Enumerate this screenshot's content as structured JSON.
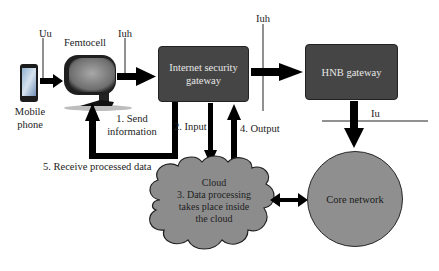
{
  "nodes": {
    "mobile_phone": {
      "label_line1": "Mobile",
      "label_line2": "phone"
    },
    "femtocell": {
      "label": "Femtocell"
    },
    "internet_security_gateway": {
      "label_line1": "Internet security",
      "label_line2": "gateway"
    },
    "hnb_gateway": {
      "label": "HNB gateway"
    },
    "cloud": {
      "title": "Cloud",
      "line1": "3. Data processing",
      "line2": "takes place inside",
      "line3": "the cloud"
    },
    "core_network": {
      "label": "Core network"
    }
  },
  "interfaces": {
    "uu": "Uu",
    "iuh_femto": "Iuh",
    "iuh_gateway": "Iuh",
    "iu": "Iu"
  },
  "steps": {
    "step1_line1": "1. Send",
    "step1_line2": "information",
    "step2": "2. Input",
    "step4": "4. Output",
    "step5": "5. Receive processed data"
  },
  "colors": {
    "box_fill": "#454545",
    "cloud_fill": "#8c8c8c",
    "circle_fill": "#8f8f8f",
    "arrow": "#000000"
  }
}
